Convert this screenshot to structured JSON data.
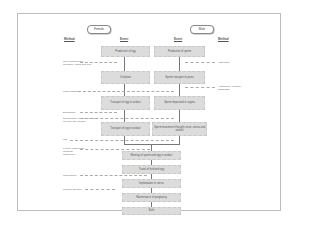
{
  "diagram": {
    "female_label": "Female",
    "male_label": "Male",
    "headers": {
      "method_left": "Method",
      "event_left": "Event",
      "event_right": "Event",
      "method_right": "Method"
    },
    "female_events": [
      "Production of egg",
      "Ovulation",
      "Transport of egg to oviduct",
      "Transport of egg in oviduct"
    ],
    "male_events": [
      "Production of sperm",
      "Sperm transport to penis",
      "Sperm deposited in vagina",
      "Sperm movement through cervix, uterus and oviduct"
    ],
    "shared_events": [
      "Meeting of sperm and egg in oviduct",
      "Travel of fertilized egg",
      "Implantation in uterus",
      "Maintenance of pregnancy",
      "Birth"
    ],
    "left_methods": [
      "Oral contraceptive, injectable, patch and ring",
      "Tubal ligation",
      "Diaphragm",
      "Spermicides, female condom, cervical cap, sponge",
      "IUD",
      "Fertility awareness methods, abstinence",
      "Mifepristone",
      "Surgical abortion"
    ],
    "right_methods": [
      "Vasectomy",
      "Abstinence, condom, withdrawal"
    ]
  }
}
